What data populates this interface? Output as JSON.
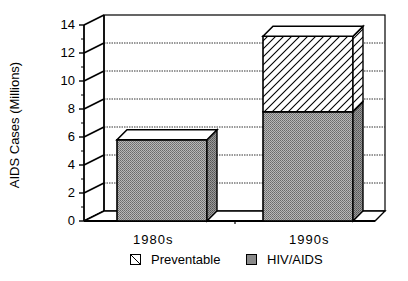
{
  "chart_data": {
    "type": "bar",
    "stacked": true,
    "style": "3d",
    "title": "",
    "xlabel": "",
    "ylabel": "AIDS Cases (Millions)",
    "ylim": [
      0,
      14
    ],
    "yticks": [
      0,
      2,
      4,
      6,
      8,
      10,
      12,
      14
    ],
    "grid": true,
    "legend_position": "bottom",
    "categories": [
      "1980s",
      "1990s"
    ],
    "series": [
      {
        "name": "HIV/AIDS",
        "values": [
          5.8,
          7.8
        ],
        "pattern": "stipple-gray"
      },
      {
        "name": "Preventable",
        "values": [
          0,
          5.4
        ],
        "pattern": "diagonal-hatch"
      }
    ]
  },
  "labels": {
    "ylabel": "AIDS Cases (Millions)",
    "ticks": [
      "0",
      "2",
      "4",
      "6",
      "8",
      "10",
      "12",
      "14"
    ],
    "cat0": "1980s",
    "cat1": "1990s",
    "legend0": "Preventable",
    "legend1": "HIV/AIDS"
  }
}
